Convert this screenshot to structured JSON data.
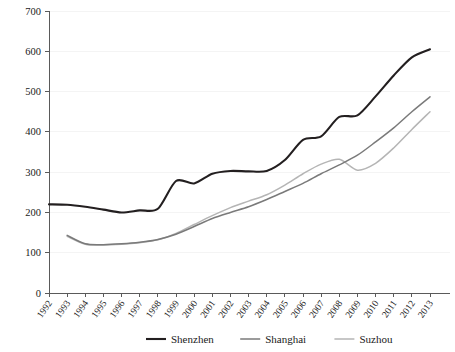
{
  "chart_data": {
    "type": "line",
    "title": "",
    "xlabel": "",
    "ylabel": "",
    "ylim": [
      0,
      700
    ],
    "ytick_step": 100,
    "grid": true,
    "legend_position": "bottom",
    "x": [
      1992,
      1993,
      1994,
      1995,
      1996,
      1997,
      1998,
      1999,
      2000,
      2001,
      2002,
      2003,
      2004,
      2005,
      2006,
      2007,
      2008,
      2009,
      2010,
      2011,
      2012,
      2013
    ],
    "categories": [
      "1992",
      "1993",
      "1994",
      "1995",
      "1996",
      "1997",
      "1998",
      "1999",
      "2000",
      "2001",
      "2002",
      "2003",
      "2004",
      "2005",
      "2006",
      "2007",
      "2008",
      "2009",
      "2010",
      "2011",
      "2012",
      "2013"
    ],
    "yticks": [
      0,
      100,
      200,
      300,
      400,
      500,
      600,
      700
    ],
    "ytick_labels": [
      "0",
      "100",
      "200",
      "300",
      "400",
      "500",
      "600",
      "700"
    ],
    "series": [
      {
        "name": "Shenzhen",
        "color": "#231f20",
        "width": 2.1,
        "values": [
          220,
          219,
          214,
          207,
          200,
          205,
          209,
          278,
          272,
          296,
          303,
          302,
          303,
          330,
          380,
          389,
          437,
          441,
          488,
          540,
          585,
          605
        ]
      },
      {
        "name": "Shanghai",
        "color": "#7a7a7a",
        "width": 1.5,
        "values": [
          null,
          143,
          122,
          120,
          122,
          126,
          133,
          146,
          165,
          185,
          200,
          214,
          232,
          252,
          272,
          296,
          318,
          342,
          375,
          410,
          450,
          487
        ]
      },
      {
        "name": "Suzhou",
        "color": "#b5b5b5",
        "width": 1.5,
        "values": [
          null,
          141,
          121,
          119,
          121,
          125,
          132,
          148,
          170,
          192,
          212,
          228,
          244,
          268,
          296,
          320,
          332,
          305,
          322,
          360,
          406,
          450
        ]
      }
    ]
  },
  "legend": {
    "items": [
      {
        "label": "Shenzhen",
        "color": "#231f20"
      },
      {
        "label": "Shanghai",
        "color": "#7a7a7a"
      },
      {
        "label": "Suzhou",
        "color": "#b5b5b5"
      }
    ]
  }
}
